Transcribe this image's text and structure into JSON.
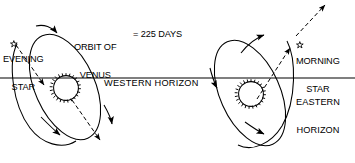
{
  "diagram": {
    "type": "astronomy-line-diagram",
    "canvas": {
      "width": 355,
      "height": 163,
      "background": "#ffffff"
    },
    "ink_color": "#000000",
    "labels": {
      "evening_star_marker": "☆",
      "evening_star_line1": "EVENING",
      "evening_star_line2": "STAR",
      "morning_star_marker": "☆",
      "morning_star_line1": "MORNING",
      "morning_star_line2": "STAR",
      "orbit_line1": "ORBIT OF",
      "orbit_line2": "VENUS",
      "orbit_period": "= 225 DAYS",
      "western_horizon": "WESTERN HORIZON",
      "eastern_horizon_line1": "EASTERN",
      "eastern_horizon_line2": "HORIZON"
    },
    "values": {
      "orbital_period_days": 225,
      "orbital_period_units": "DAYS"
    },
    "elements": {
      "horizon_line": "full-width horizontal line",
      "left_orbit_ellipse": "tilted ellipse with directional arrows, evening apparition",
      "right_orbit_ellipse": "tilted ellipse with directional arrows, morning apparition",
      "left_sun": "sun-icon at center of left ellipse",
      "right_sun": "sun-icon at center of right ellipse",
      "left_sight_line": "dashed arrow from evening star downward-right",
      "right_sight_line": "dashed arrow from right ellipse upward-right past morning star"
    }
  }
}
